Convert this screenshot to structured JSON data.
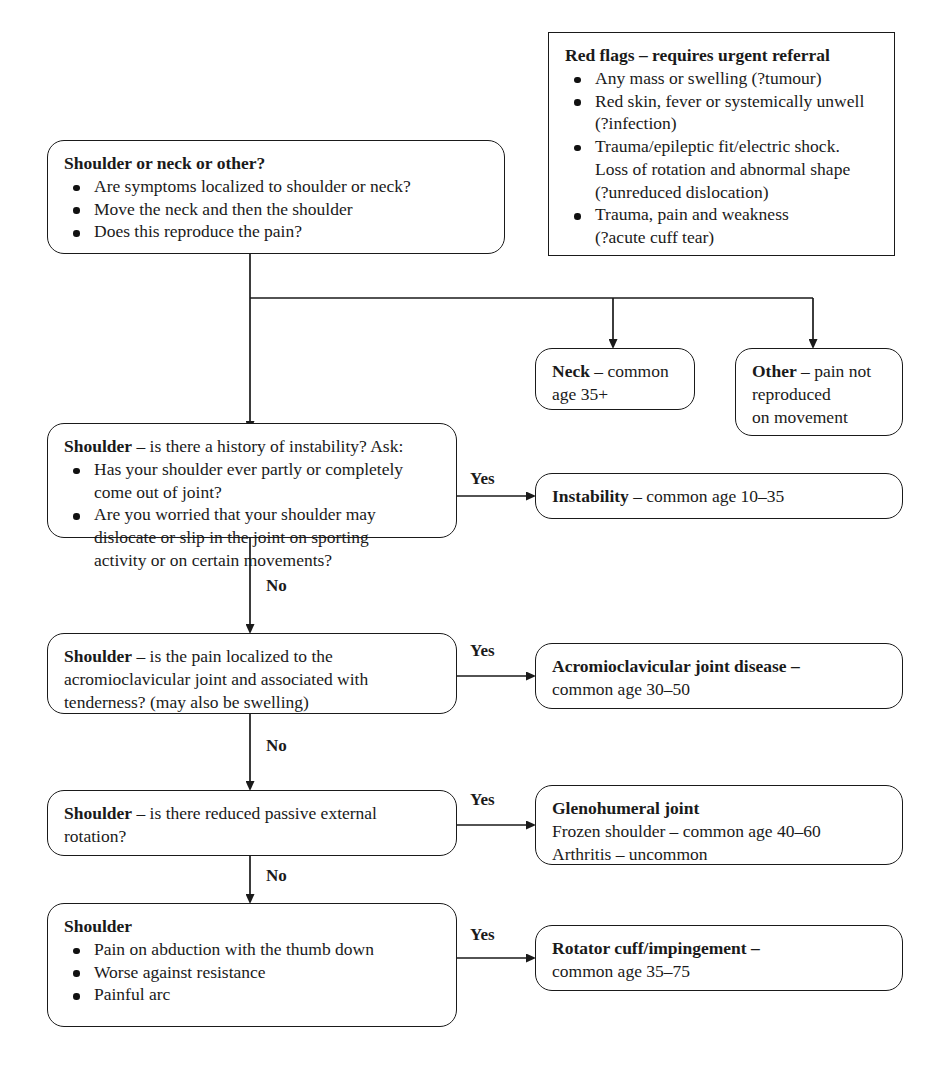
{
  "diagram": {
    "colors": {
      "stroke": "#1a1a1a",
      "background": "#ffffff"
    }
  },
  "red_flags": {
    "heading": "Red flags – requires urgent referral",
    "items": [
      {
        "line1": "Any mass or swelling (?tumour)",
        "line2": "",
        "line3": ""
      },
      {
        "line1": "Red skin, fever or systemically unwell",
        "line2": "(?infection)",
        "line3": ""
      },
      {
        "line1": "Trauma/epileptic fit/electric shock.",
        "line2": "Loss of rotation and abnormal shape",
        "line3": "(?unreduced dislocation)"
      },
      {
        "line1": "Trauma, pain and weakness",
        "line2": "(?acute cuff tear)",
        "line3": ""
      }
    ]
  },
  "triage": {
    "heading": "Shoulder or neck or other?",
    "items": [
      "Are symptoms localized to shoulder or neck?",
      "Move the neck and then the shoulder",
      "Does this reproduce the pain?"
    ]
  },
  "neck_outcome": {
    "bold": "Neck",
    "rest": " – common",
    "line2": "age 35+"
  },
  "other_outcome": {
    "bold": "Other",
    "rest": " – pain not",
    "line2": "reproduced",
    "line3": "on movement"
  },
  "instability": {
    "question": {
      "bold": "Shoulder",
      "rest": " – is there a history of instability? Ask:",
      "items": [
        {
          "line1": "Has your shoulder ever partly or completely",
          "line2": "come out of joint?",
          "line3": ""
        },
        {
          "line1": "Are you worried that your shoulder may",
          "line2": "dislocate or slip in the joint on sporting",
          "line3": "activity or on certain movements?"
        }
      ]
    },
    "result": {
      "bold": "Instability",
      "rest": " – common age 10–35"
    },
    "yes_label": "Yes",
    "no_label": "No"
  },
  "acromioclavicular": {
    "question": {
      "bold": "Shoulder",
      "rest": " – is the pain localized to the",
      "line2": "acromioclavicular joint and associated with",
      "line3": "tenderness? (may also be swelling)"
    },
    "result": {
      "bold": "Acromioclavicular joint disease –",
      "line2": "common age 30–50"
    },
    "yes_label": "Yes",
    "no_label": "No"
  },
  "glenohumeral": {
    "question": {
      "bold": "Shoulder",
      "rest": " – is there reduced passive external",
      "line2": "rotation?"
    },
    "result": {
      "bold": "Glenohumeral joint",
      "line2": "Frozen shoulder – common age 40–60",
      "line3": "Arthritis – uncommon"
    },
    "yes_label": "Yes",
    "no_label": "No"
  },
  "rotator_cuff": {
    "question": {
      "bold": "Shoulder",
      "items": [
        "Pain on abduction with the thumb down",
        "Worse against resistance",
        "Painful arc"
      ]
    },
    "result": {
      "bold": "Rotator cuff/impingement –",
      "line2": "common age 35–75"
    },
    "yes_label": "Yes"
  }
}
